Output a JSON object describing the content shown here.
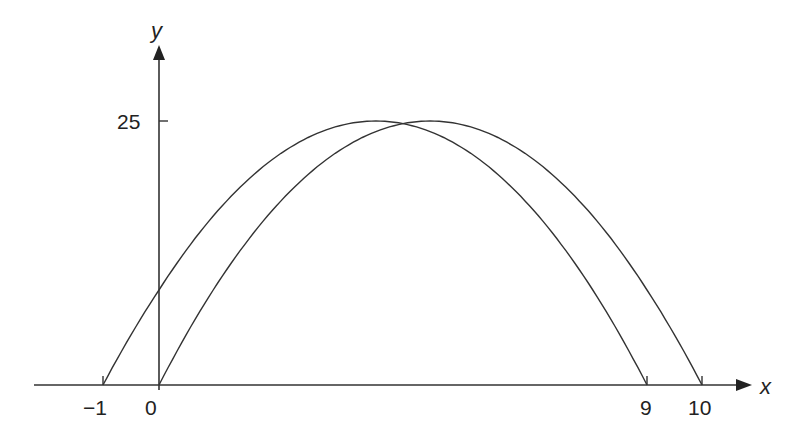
{
  "chart_data": {
    "type": "line",
    "title": "",
    "xlabel": "x",
    "ylabel": "y",
    "x_ticks": [
      {
        "label": "−1",
        "value": -1,
        "px": 103
      },
      {
        "label": "0",
        "value": 0,
        "px": 159
      },
      {
        "label": "9",
        "value": 9,
        "px": 647
      },
      {
        "label": "10",
        "value": 10,
        "px": 702
      }
    ],
    "y_ticks": [
      {
        "label": "25",
        "value": 25
      }
    ],
    "series": [
      {
        "name": "y = (x + 1)(9 − x)",
        "roots": [
          -1,
          9
        ],
        "vertex": [
          4,
          25
        ],
        "y_intercept": 9
      },
      {
        "name": "y = x(10 − x)",
        "roots": [
          0,
          10
        ],
        "vertex": [
          5,
          25
        ],
        "y_intercept": 0
      }
    ],
    "grid": false,
    "legend": "none"
  },
  "axes": {
    "x_label": "x",
    "y_label": "y",
    "origin_label": "0",
    "tick_labels": {
      "neg1": "−1",
      "zero": "0",
      "nine": "9",
      "ten": "10",
      "y25": "25"
    }
  },
  "colors": {
    "stroke": "#333333",
    "background": "#ffffff"
  }
}
